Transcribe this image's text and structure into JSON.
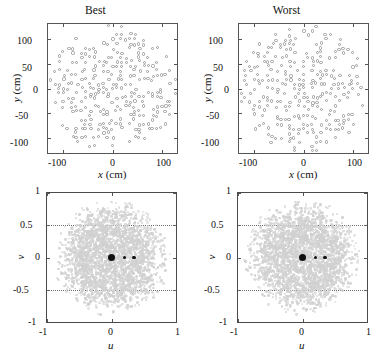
{
  "figure": {
    "panels": [
      {
        "id": "best-xy",
        "title": "Best",
        "xlabel_var": "x",
        "xlabel_unit": "(cm)",
        "ylabel_var": "y",
        "ylabel_unit": "(cm)",
        "xticks": [
          "-100",
          "0",
          "100"
        ],
        "yticks": [
          "100",
          "50",
          "0",
          "-50",
          "-100"
        ]
      },
      {
        "id": "worst-xy",
        "title": "Worst",
        "xlabel_var": "x",
        "xlabel_unit": "(cm)",
        "ylabel_var": "y",
        "ylabel_unit": "(cm)",
        "xticks": [
          "-100",
          "0",
          "100"
        ],
        "yticks": [
          "100",
          "50",
          "0",
          "-50",
          "-100"
        ]
      },
      {
        "id": "best-uv",
        "title": "",
        "xlabel_var": "u",
        "xlabel_unit": "",
        "ylabel_var": "v",
        "ylabel_unit": "",
        "xticks": [
          "-1",
          "0",
          "1"
        ],
        "yticks": [
          "1",
          "0.5",
          "0",
          "-0.5",
          "-1"
        ]
      },
      {
        "id": "worst-uv",
        "title": "",
        "xlabel_var": "u",
        "xlabel_unit": "",
        "ylabel_var": "v",
        "ylabel_unit": "",
        "xticks": [
          "-1",
          "0",
          "1"
        ],
        "yticks": [
          "1",
          "0.5",
          "0",
          "-0.5",
          "-1"
        ]
      }
    ]
  },
  "chart_data": [
    {
      "type": "scatter",
      "id": "best-xy",
      "title": "Best",
      "xlabel": "x (cm)",
      "ylabel": "y (cm)",
      "xlim": [
        -130,
        130
      ],
      "ylim": [
        -130,
        130
      ],
      "xticks": [
        -100,
        0,
        100
      ],
      "yticks": [
        -100,
        -50,
        0,
        50,
        100
      ],
      "grid": false,
      "marker": "open-circle",
      "marker_color": "#9a9a9a",
      "marker_size_px": 3.2,
      "n_points": 520,
      "description": "Antenna element positions on a quasi-random thinned square lattice filling a roughly circular aperture of radius ~130 cm",
      "lattice_pitch_cm": 9.0,
      "fill_fraction": 0.55
    },
    {
      "type": "scatter",
      "id": "worst-xy",
      "title": "Worst",
      "xlabel": "x (cm)",
      "ylabel": "y (cm)",
      "xlim": [
        -130,
        130
      ],
      "ylim": [
        -130,
        130
      ],
      "xticks": [
        -100,
        0,
        100
      ],
      "yticks": [
        -100,
        -50,
        0,
        50,
        100
      ],
      "grid": false,
      "marker": "open-circle",
      "marker_color": "#9a9a9a",
      "marker_size_px": 3.2,
      "n_points": 520,
      "description": "Antenna element positions, worst-case thinned array layout, clustered more densely toward the centre",
      "lattice_pitch_cm": 9.0,
      "fill_fraction": 0.58
    },
    {
      "type": "scatter",
      "id": "best-uv",
      "title": "",
      "xlabel": "u",
      "ylabel": "v",
      "xlim": [
        -1,
        1
      ],
      "ylim": [
        -1,
        1
      ],
      "xticks": [
        -1,
        0,
        1
      ],
      "yticks": [
        -1,
        -0.5,
        0,
        0.5,
        1
      ],
      "grid": true,
      "grid_style": "dotted",
      "marker": "dot",
      "marker_color": "#d0d0d0",
      "cloud_radius": 0.92,
      "n_points": 2600,
      "highlight_points": [
        {
          "u": 0.0,
          "v": 0.0,
          "size_px": 7.5,
          "color": "#111111"
        },
        {
          "u": 0.2,
          "v": 0.0,
          "size_px": 3.2,
          "color": "#111111"
        },
        {
          "u": 0.35,
          "v": 0.0,
          "size_px": 3.2,
          "color": "#111111"
        }
      ],
      "description": "u-v coverage: dense light-grey sampling disk with three dark highlighted baselines on the u axis"
    },
    {
      "type": "scatter",
      "id": "worst-uv",
      "title": "",
      "xlabel": "u",
      "ylabel": "v",
      "xlim": [
        -1,
        1
      ],
      "ylim": [
        -1,
        1
      ],
      "xticks": [
        -1,
        0,
        1
      ],
      "yticks": [
        -1,
        -0.5,
        0,
        0.5,
        1
      ],
      "grid": true,
      "grid_style": "dotted",
      "marker": "dot",
      "marker_color": "#d0d0d0",
      "cloud_radius": 0.92,
      "n_points": 2600,
      "highlight_points": [
        {
          "u": 0.0,
          "v": 0.0,
          "size_px": 7.5,
          "color": "#111111"
        },
        {
          "u": 0.2,
          "v": 0.0,
          "size_px": 3.2,
          "color": "#111111"
        },
        {
          "u": 0.35,
          "v": 0.0,
          "size_px": 3.2,
          "color": "#111111"
        }
      ],
      "description": "u-v coverage for worst layout: dense light-grey sampling disk with three dark highlighted baselines on the u axis"
    }
  ]
}
